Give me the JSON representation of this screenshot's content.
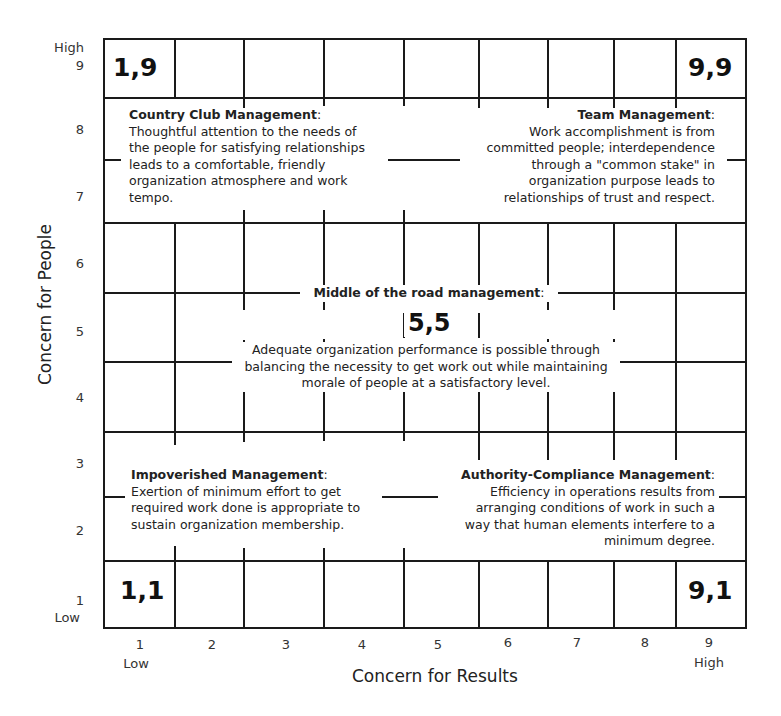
{
  "y_axis": {
    "title": "Concern for People",
    "ticks": [
      "1",
      "2",
      "3",
      "4",
      "5",
      "6",
      "7",
      "8",
      "9"
    ],
    "low_label": "Low",
    "high_label": "High"
  },
  "x_axis": {
    "title": "Concern for Results",
    "ticks": [
      "1",
      "2",
      "3",
      "4",
      "5",
      "6",
      "7",
      "8",
      "9"
    ],
    "low_label": "Low",
    "high_label": "High"
  },
  "corners": {
    "top_left": "1,9",
    "top_right": "9,9",
    "bottom_left": "1,1",
    "bottom_right": "9,1",
    "center": "5,5"
  },
  "styles": {
    "country_club": {
      "title": "Country Club Management",
      "lines": [
        "Thoughtful attention to the needs of",
        "the people for satisfying relationships",
        "leads to a comfortable, friendly",
        "organization atmosphere and work",
        "tempo."
      ]
    },
    "team": {
      "title": "Team Management",
      "lines": [
        "Work accomplishment is from",
        "committed people; interdependence",
        "through a \"common stake\" in",
        "organization purpose leads to",
        "relationships of trust and respect."
      ]
    },
    "middle": {
      "title": "Middle of the road management",
      "lines": [
        "Adequate organization performance is possible through",
        "balancing the necessity to get work out  while maintaining",
        "morale of people at a satisfactory level."
      ]
    },
    "impoverished": {
      "title": "Impoverished Management",
      "lines": [
        "Exertion of minimum effort to get",
        "required work done is appropriate to",
        "sustain organization membership."
      ]
    },
    "authority": {
      "title": "Authority-Compliance Management",
      "lines": [
        "Efficiency in operations results from",
        "arranging conditions of work in such a",
        "way that human elements interfere to a",
        "minimum degree."
      ]
    }
  }
}
